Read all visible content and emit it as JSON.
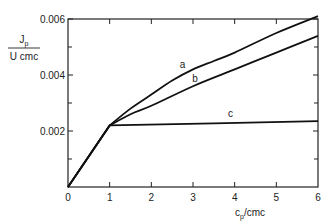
{
  "chart_data": {
    "type": "line",
    "title": "",
    "xlabel": "c_p/cmc",
    "ylabel_numerator": "J_p",
    "ylabel_denominator": "U cmc",
    "xlim": [
      0,
      6
    ],
    "ylim": [
      0,
      0.006
    ],
    "x_ticks": [
      0,
      1,
      2,
      3,
      4,
      5,
      6
    ],
    "x_tick_labels": [
      "0",
      "1",
      "2",
      "3",
      "4",
      "5",
      "6"
    ],
    "y_ticks": [
      0.002,
      0.004,
      0.006
    ],
    "y_tick_labels": [
      "0.002",
      "0.004",
      "0.006"
    ],
    "y_minor_ticks": [
      0.001,
      0.003,
      0.005
    ],
    "grid": false,
    "series": [
      {
        "name": "a",
        "x": [
          0,
          1,
          1.5,
          2,
          2.5,
          3,
          3.5,
          4,
          5,
          6
        ],
        "values": [
          0,
          0.0022,
          0.0028,
          0.0033,
          0.0038,
          0.0042,
          0.0045,
          0.0048,
          0.0055,
          0.0061
        ]
      },
      {
        "name": "b",
        "x": [
          0,
          1,
          1.5,
          2,
          3,
          4,
          5,
          6
        ],
        "values": [
          0,
          0.0022,
          0.0026,
          0.0029,
          0.0036,
          0.0042,
          0.0048,
          0.0054
        ]
      },
      {
        "name": "c",
        "x": [
          0,
          1,
          6
        ],
        "values": [
          0,
          0.0022,
          0.00235
        ]
      }
    ],
    "annotations": [
      {
        "text": "a",
        "x": 2.75,
        "y": 0.0041
      },
      {
        "text": "b",
        "x": 3.05,
        "y": 0.0036
      },
      {
        "text": "c",
        "x": 3.9,
        "y": 0.00235
      }
    ]
  }
}
